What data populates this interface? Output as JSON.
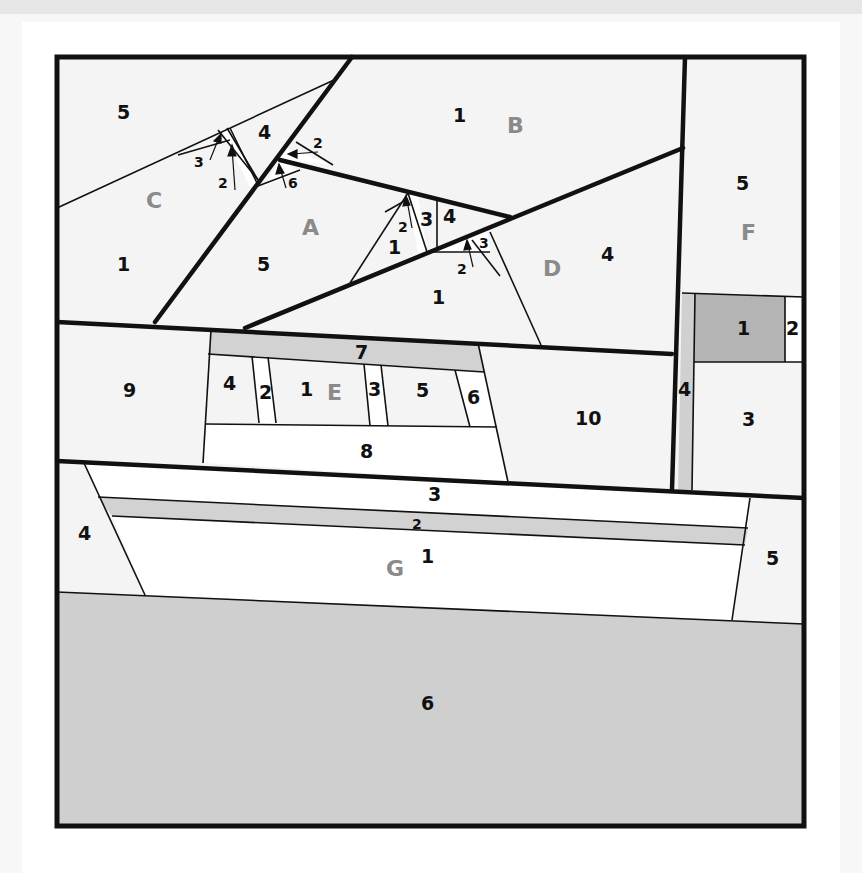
{
  "diagram": {
    "type": "foundation-paper-piecing-pattern",
    "colors": {
      "light_fabric": "#f4f4f4",
      "white_fabric": "#ffffff",
      "mid_gray_fabric": "#d4d4d4",
      "dark_gray_fabric": "#b4b4b4",
      "outline": "#111111",
      "section_letter": "#8a8a8a"
    },
    "sections": {
      "A": {
        "label": "A",
        "pieces": [
          "1",
          "2",
          "3",
          "4",
          "5",
          "6"
        ]
      },
      "B": {
        "label": "B",
        "pieces": [
          "1",
          "2"
        ]
      },
      "C": {
        "label": "C",
        "pieces": [
          "1",
          "2",
          "3",
          "4",
          "5"
        ]
      },
      "D": {
        "label": "D",
        "pieces": [
          "1",
          "2",
          "3",
          "4"
        ]
      },
      "E": {
        "label": "E",
        "pieces": [
          "1",
          "2",
          "3",
          "4",
          "5",
          "6",
          "7",
          "8",
          "9",
          "10"
        ]
      },
      "F": {
        "label": "F",
        "pieces": [
          "1",
          "2",
          "3",
          "4",
          "5"
        ]
      },
      "G": {
        "label": "G",
        "pieces": [
          "1",
          "2",
          "3",
          "4",
          "5",
          "6"
        ]
      }
    },
    "labels": {
      "c5": "5",
      "c1": "1",
      "c4": "4",
      "c3": "3",
      "c2": "2",
      "b1": "1",
      "b2": "2",
      "a6": "6",
      "a5": "5",
      "a1": "1",
      "a2": "2",
      "a3": "3",
      "a4": "4",
      "d1": "1",
      "d2": "2",
      "d3": "3",
      "d4": "4",
      "f5": "5",
      "f1": "1",
      "f2": "2",
      "f3": "3",
      "f4": "4",
      "e9": "9",
      "e7": "7",
      "e4": "4",
      "e2": "2",
      "e1": "1",
      "e3": "3",
      "e5": "5",
      "e6": "6",
      "e8": "8",
      "e10": "10",
      "g3": "3",
      "g2": "2",
      "g1": "1",
      "g4": "4",
      "g5": "5",
      "g6": "6"
    }
  }
}
